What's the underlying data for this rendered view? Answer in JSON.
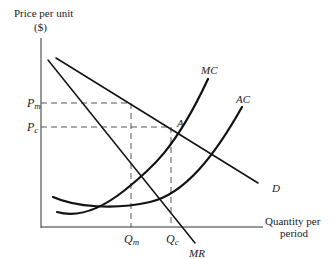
{
  "diagram": {
    "y_axis": {
      "label_line1": "Price per unit",
      "label_line2": "($)"
    },
    "x_axis": {
      "label_line1": "Quantity per",
      "label_line2": "period"
    },
    "price_ticks": [
      {
        "main": "P",
        "sub": "m"
      },
      {
        "main": "P",
        "sub": "c"
      }
    ],
    "quantity_ticks": [
      {
        "main": "Q",
        "sub": "m"
      },
      {
        "main": "Q",
        "sub": "c"
      }
    ],
    "curves": {
      "demand": "D",
      "marginal_revenue": "MR",
      "marginal_cost": "MC",
      "average_cost": "AC"
    },
    "points": {
      "intersection": "A"
    },
    "colors": {
      "line": "#111111",
      "text": "#222222",
      "background": "#ffffff"
    }
  }
}
